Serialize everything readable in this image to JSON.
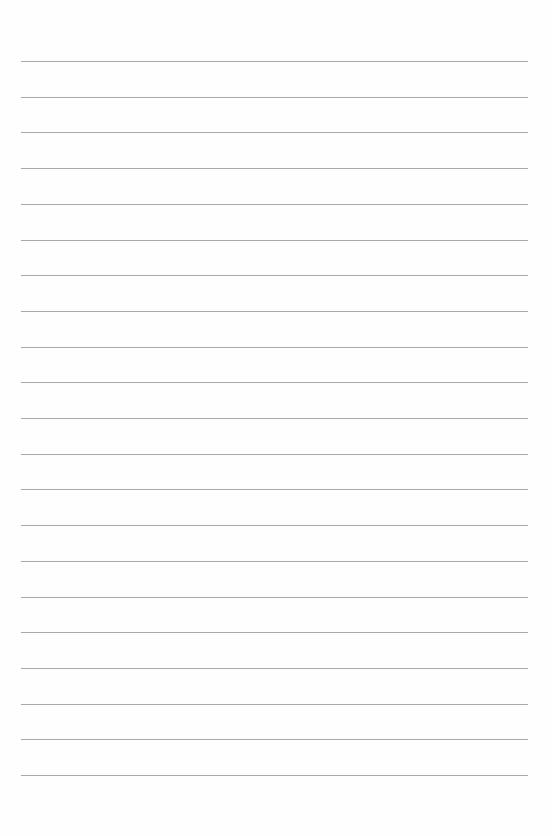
{
  "page": {
    "type": "lined-paper",
    "background_color": "#fefefe",
    "line_color": "#9a9a9a",
    "line_count": 21,
    "first_line_y": 61,
    "line_spacing": 35.7,
    "line_left": 21,
    "line_right": 528
  }
}
